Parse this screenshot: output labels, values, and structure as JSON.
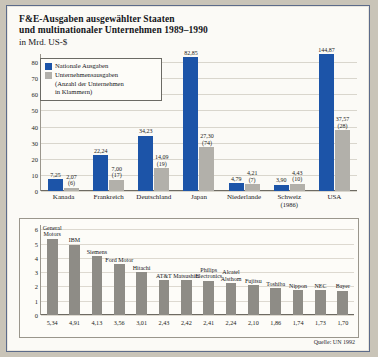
{
  "title": {
    "line1": "F&E-Ausgaben ausgewählter Staaten",
    "line2": "und multinationaler Unternehmen 1989–1990",
    "subtitle": "in Mrd. US-$"
  },
  "legend": {
    "national_label": "Nationale Ausgaben",
    "corporate_label": "Unternehmensausgaben",
    "corporate_note_1": "(Anzahl  der Unternehmen",
    "corporate_note_2": "in Klammern)",
    "national_color": "#1c54a8",
    "corporate_color": "#b2b0aa"
  },
  "source": "Quelle: UN 1992",
  "chart_data": [
    {
      "type": "bar",
      "title": "F&E-Ausgaben ausgewählter Staaten und multinationaler Unternehmen 1989–1990",
      "xlabel": "",
      "ylabel": "in Mrd. US-$",
      "ylim": [
        0,
        85
      ],
      "yticks": [
        0,
        10,
        20,
        30,
        40,
        50,
        60,
        70,
        80
      ],
      "grid": true,
      "legend_position": "top-left",
      "axis_break_note": "USA Nationale Ausgaben bar is truncated (value 144,87 exceeds axis)",
      "categories": [
        "Kanada",
        "Frankreich",
        "Deutschland",
        "Japan",
        "Niederlande",
        "Schweiz",
        "USA"
      ],
      "category_sublabels": [
        "",
        "",
        "",
        "",
        "",
        "(1986)",
        ""
      ],
      "series": [
        {
          "name": "Nationale Ausgaben",
          "color": "#1c54a8",
          "values": [
            7.25,
            22.24,
            34.23,
            82.85,
            4.79,
            3.9,
            144.87
          ],
          "labels": [
            "7,25",
            "22,24",
            "34,23",
            "82,85",
            "4,79",
            "3,90",
            "144,87"
          ]
        },
        {
          "name": "Unternehmensausgaben",
          "color": "#b2b0aa",
          "values": [
            2.07,
            7.0,
            14.09,
            27.3,
            4.21,
            4.43,
            37.57
          ],
          "labels": [
            "2,07",
            "7,00",
            "14,09",
            "27,30",
            "4,21",
            "4,43",
            "37,57"
          ],
          "counts": [
            "(6)",
            "(17)",
            "(19)",
            "(74)",
            "(7)",
            "(10)",
            "(28)"
          ]
        }
      ]
    },
    {
      "type": "bar",
      "title": "",
      "xlabel": "",
      "ylabel": "",
      "ylim": [
        0,
        6.3
      ],
      "yticks": [
        0,
        1,
        2,
        3,
        4,
        5,
        6
      ],
      "grid": true,
      "bar_color": "#8e8c86",
      "categories": [
        "General\nMotors",
        "IBM",
        "Siemens",
        "Ford Motor",
        "Hitachi",
        "AT&T",
        "Matsushita",
        "Philips\nElectronics",
        "Alcatel\nAlsthom",
        "Fujitsu",
        "Toshiba",
        "Nippon",
        "NEC",
        "Bayer"
      ],
      "values": [
        5.34,
        4.91,
        4.13,
        3.56,
        3.01,
        2.43,
        2.42,
        2.41,
        2.24,
        2.1,
        1.86,
        1.74,
        1.73,
        1.7
      ],
      "labels": [
        "5,34",
        "4,91",
        "4,13",
        "3,56",
        "3,01",
        "2,43",
        "2,42",
        "2,41",
        "2,24",
        "2,10",
        "1,86",
        "1,74",
        "1,73",
        "1,70"
      ]
    }
  ]
}
